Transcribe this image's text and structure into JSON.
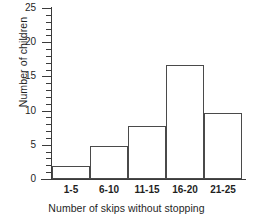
{
  "chart_data": {
    "type": "bar",
    "title": "",
    "subtitle": "",
    "xlabel": "Number of skips without stopping",
    "ylabel": "Number of children",
    "categories": [
      "1-5",
      "6-10",
      "11-15",
      "16-20",
      "21-25"
    ],
    "values": [
      1.9,
      4.8,
      7.7,
      16.6,
      9.6
    ],
    "series": [
      {
        "name": "Number of children",
        "values": [
          1.9,
          4.8,
          7.7,
          16.6,
          9.6
        ]
      }
    ],
    "ylim": [
      0,
      25
    ],
    "y_major_ticks": [
      0,
      5,
      10,
      15,
      20,
      25
    ],
    "y_tick_labels": [
      "0",
      "5",
      "10",
      "15",
      "20",
      "25"
    ],
    "y_minor_tick_step": 1,
    "grid": false,
    "legend": false,
    "legend_position": "none",
    "bar_fill_color": "#ffffff",
    "bar_edge_color": "#4a4a4a",
    "axis_color": "#3b3b3b"
  }
}
